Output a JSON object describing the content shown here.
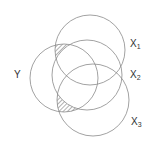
{
  "diagram": {
    "type": "venn",
    "circles": [
      {
        "id": "X1",
        "label": "X",
        "sub": "1",
        "cx": 90,
        "cy": 50,
        "r": 35
      },
      {
        "id": "X2",
        "label": "X",
        "sub": "2",
        "cx": 87,
        "cy": 75,
        "r": 35
      },
      {
        "id": "X3",
        "label": "X",
        "sub": "3",
        "cx": 93,
        "cy": 100,
        "r": 36
      },
      {
        "id": "Y",
        "label": "Y",
        "sub": "",
        "cx": 64,
        "cy": 78,
        "r": 34
      }
    ],
    "shaded_region": "Y ∩ (X1 ∪ X3) − X2",
    "stroke_color": "#8a8a8a",
    "hatch_color": "#555555"
  }
}
